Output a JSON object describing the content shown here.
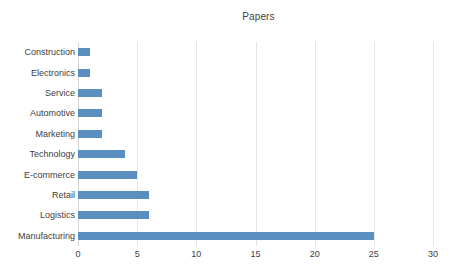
{
  "chart_data": {
    "type": "bar",
    "orientation": "horizontal",
    "title": "Papers",
    "xlabel": "",
    "ylabel": "",
    "categories": [
      "Construction",
      "Electronics",
      "Service",
      "Automotive",
      "Marketing",
      "Technology",
      "E-commerce",
      "Retail",
      "Logistics",
      "Manufacturing"
    ],
    "values": [
      1,
      1,
      2,
      2,
      2,
      4,
      5,
      6,
      6,
      25
    ],
    "xlim": [
      0,
      30
    ],
    "xticks": [
      0,
      5,
      10,
      15,
      20,
      25,
      30
    ],
    "xtick_labels": [
      "0",
      "5",
      "10",
      "15",
      "20",
      "25",
      "30"
    ],
    "grid": "vertical",
    "legend": "none",
    "bar_color": "#5b8fc0",
    "gridline_color": "#e4e6e8",
    "axis_color": "#d4d6d8",
    "text_color": "#404040",
    "title_color": "#3f3f3f",
    "background": "#ffffff"
  }
}
